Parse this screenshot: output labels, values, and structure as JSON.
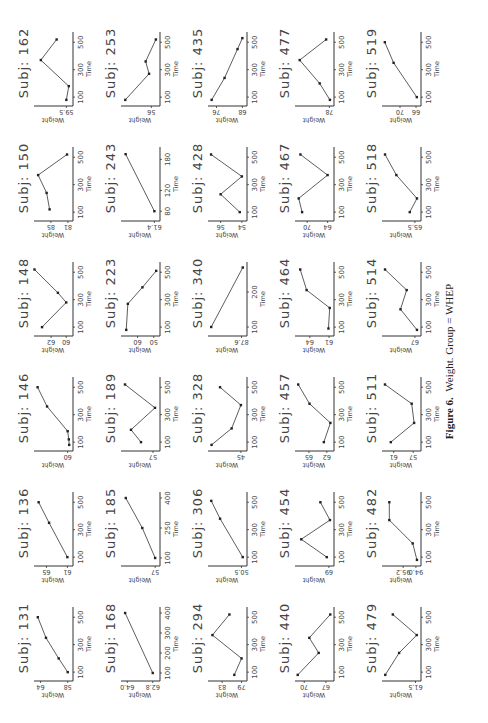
{
  "figure": {
    "caption_label": "Figure 6.",
    "caption_text": "Weight. Group = WHEP"
  },
  "chart_data": {
    "type": "line",
    "xlabel": "Time",
    "ylabel": "Weight",
    "layout": {
      "rows": 5,
      "cols": 6,
      "orientation": "page rotated 90 degrees"
    },
    "panels": [
      {
        "subject": "Subj: 131",
        "xticks": [
          100,
          300,
          500
        ],
        "yticks": [
          58,
          64
        ],
        "xlim": [
          50,
          560
        ],
        "ylim": [
          57.5,
          65
        ],
        "points": [
          [
            100,
            58
          ],
          [
            200,
            60
          ],
          [
            350,
            62.8
          ],
          [
            500,
            64.6
          ]
        ]
      },
      {
        "subject": "Subj: 136",
        "xticks": [
          100,
          300,
          500
        ],
        "yticks": [
          61,
          65
        ],
        "xlim": [
          50,
          560
        ],
        "ylim": [
          60.5,
          67
        ],
        "points": [
          [
            100,
            61
          ],
          [
            350,
            64.5
          ],
          [
            500,
            66.5
          ]
        ]
      },
      {
        "subject": "Subj: 146",
        "xticks": [
          100,
          300,
          500
        ],
        "yticks": [
          60.0
        ],
        "xlim": [
          50,
          560
        ],
        "ylim": [
          59.7,
          64
        ],
        "points": [
          [
            80,
            59.8
          ],
          [
            120,
            59.85
          ],
          [
            180,
            60
          ],
          [
            360,
            62.6
          ],
          [
            500,
            63.8
          ]
        ]
      },
      {
        "subject": "Subj: 148",
        "xticks": [
          100,
          300,
          500
        ],
        "yticks": [
          60,
          62
        ],
        "xlim": [
          50,
          560
        ],
        "ylim": [
          59.5,
          64
        ],
        "points": [
          [
            100,
            63.2
          ],
          [
            280,
            60
          ],
          [
            350,
            61.1
          ],
          [
            520,
            64.2
          ]
        ]
      },
      {
        "subject": "Subj: 150",
        "xticks": [
          100,
          300,
          500
        ],
        "yticks": [
          81,
          85
        ],
        "xlim": [
          50,
          560
        ],
        "ylim": [
          80.5,
          88.5
        ],
        "points": [
          [
            120,
            85.3
          ],
          [
            240,
            86
          ],
          [
            370,
            88
          ],
          [
            520,
            81.2
          ]
        ]
      },
      {
        "subject": "Subj: 162",
        "xticks": [
          100,
          300,
          500
        ],
        "yticks": [
          59.5
        ],
        "xlim": [
          50,
          560
        ],
        "ylim": [
          59.2,
          62
        ],
        "points": [
          [
            80,
            59.5
          ],
          [
            180,
            59.3
          ],
          [
            370,
            61.6
          ],
          [
            520,
            60.3
          ]
        ]
      },
      {
        "subject": "Subj: 168",
        "xticks": [
          100,
          200,
          300,
          400
        ],
        "yticks": [
          62.8,
          64.0
        ],
        "xlim": [
          70,
          420
        ],
        "ylim": [
          62.6,
          64.2
        ],
        "points": [
          [
            100,
            62.8
          ],
          [
            400,
            64.1
          ]
        ]
      },
      {
        "subject": "Subj: 185",
        "xticks": [
          100,
          250,
          400
        ],
        "yticks": [
          57.0
        ],
        "xlim": [
          70,
          420
        ],
        "ylim": [
          56.8,
          60.5
        ],
        "points": [
          [
            100,
            57
          ],
          [
            250,
            58.4
          ],
          [
            400,
            60.2
          ]
        ]
      },
      {
        "subject": "Subj: 189",
        "xticks": [
          100,
          300,
          500
        ],
        "yticks": [
          57.0
        ],
        "xlim": [
          50,
          560
        ],
        "ylim": [
          56.8,
          58.5
        ],
        "points": [
          [
            100,
            57.6
          ],
          [
            190,
            58.1
          ],
          [
            350,
            56.9
          ],
          [
            520,
            58.4
          ]
        ]
      },
      {
        "subject": "Subj: 223",
        "xticks": [
          100,
          300,
          500
        ],
        "yticks": [
          50,
          60
        ],
        "xlim": [
          50,
          560
        ],
        "ylim": [
          48,
          69
        ],
        "points": [
          [
            80,
            67
          ],
          [
            270,
            66
          ],
          [
            390,
            57
          ],
          [
            510,
            48.5
          ]
        ]
      },
      {
        "subject": "Subj: 243",
        "xticks": [
          80,
          120,
          180
        ],
        "yticks": [
          61.4
        ],
        "xlim": [
          65,
          200
        ],
        "ylim": [
          61.3,
          62.6
        ],
        "points": [
          [
            80,
            61.4
          ],
          [
            190,
            62.5
          ]
        ]
      },
      {
        "subject": "Subj: 253",
        "xticks": [
          100,
          300,
          500
        ],
        "yticks": [
          56.0
        ],
        "xlim": [
          50,
          560
        ],
        "ylim": [
          55.5,
          58.5
        ],
        "points": [
          [
            80,
            58.3
          ],
          [
            270,
            56.2
          ],
          [
            360,
            56.5
          ],
          [
            520,
            55.6
          ]
        ]
      },
      {
        "subject": "Subj: 294",
        "xticks": [
          100,
          300,
          500
        ],
        "yticks": [
          79,
          83
        ],
        "xlim": [
          50,
          560
        ],
        "ylim": [
          78.5,
          85.5
        ],
        "points": [
          [
            80,
            80.5
          ],
          [
            200,
            79
          ],
          [
            370,
            85
          ],
          [
            520,
            81.5
          ]
        ]
      },
      {
        "subject": "Subj: 306",
        "xticks": [
          100,
          300,
          500
        ],
        "yticks": [
          50.5
        ],
        "xlim": [
          50,
          560
        ],
        "ylim": [
          50.3,
          53
        ],
        "points": [
          [
            100,
            50.4
          ],
          [
            380,
            52.2
          ],
          [
            510,
            52.9
          ]
        ]
      },
      {
        "subject": "Subj: 328",
        "xticks": [
          100,
          300,
          500
        ],
        "yticks": [
          45.0
        ],
        "xlim": [
          50,
          560
        ],
        "ylim": [
          44.6,
          49
        ],
        "points": [
          [
            80,
            48.8
          ],
          [
            200,
            46.2
          ],
          [
            370,
            45
          ],
          [
            500,
            47.7
          ]
        ]
      },
      {
        "subject": "Subj: 340",
        "xticks": [
          100,
          200
        ],
        "yticks": [
          87.6
        ],
        "xlim": [
          80,
          280
        ],
        "ylim": [
          87.4,
          90.2
        ],
        "points": [
          [
            100,
            90.1
          ],
          [
            270,
            87.5
          ]
        ]
      },
      {
        "subject": "Subj: 428",
        "xticks": [
          100,
          300,
          500
        ],
        "yticks": [
          54.0,
          56.0
        ],
        "xlim": [
          50,
          560
        ],
        "ylim": [
          53.8,
          57
        ],
        "points": [
          [
            100,
            54.2
          ],
          [
            230,
            56
          ],
          [
            360,
            54
          ],
          [
            520,
            56.9
          ]
        ]
      },
      {
        "subject": "Subj: 435",
        "xticks": [
          100,
          300,
          500
        ],
        "yticks": [
          68,
          76
        ],
        "xlim": [
          50,
          560
        ],
        "ylim": [
          67.5,
          78
        ],
        "points": [
          [
            80,
            77.5
          ],
          [
            240,
            73.5
          ],
          [
            450,
            69.5
          ],
          [
            530,
            68
          ]
        ]
      },
      {
        "subject": "Subj: 440",
        "xticks": [
          100,
          300,
          500
        ],
        "yticks": [
          67,
          70
        ],
        "xlim": [
          50,
          560
        ],
        "ylim": [
          66.3,
          71
        ],
        "points": [
          [
            80,
            70.9
          ],
          [
            240,
            68
          ],
          [
            350,
            69.3
          ],
          [
            520,
            66.4
          ]
        ]
      },
      {
        "subject": "Subj: 454",
        "xticks": [
          100,
          300,
          500
        ],
        "yticks": [
          69.0
        ],
        "xlim": [
          50,
          560
        ],
        "ylim": [
          68.8,
          72
        ],
        "points": [
          [
            100,
            69.2
          ],
          [
            230,
            71.6
          ],
          [
            370,
            68.9
          ],
          [
            500,
            69.8
          ]
        ]
      },
      {
        "subject": "Subj: 457",
        "xticks": [
          100,
          300,
          500
        ],
        "yticks": [
          62,
          65
        ],
        "xlim": [
          50,
          560
        ],
        "ylim": [
          61.3,
          67
        ],
        "points": [
          [
            100,
            62.5
          ],
          [
            240,
            61.4
          ],
          [
            380,
            64.9
          ],
          [
            520,
            66.8
          ]
        ]
      },
      {
        "subject": "Subj: 464",
        "xticks": [
          100,
          300,
          500
        ],
        "yticks": [
          61,
          64
        ],
        "xlim": [
          50,
          560
        ],
        "ylim": [
          60.7,
          66
        ],
        "points": [
          [
            90,
            61.1
          ],
          [
            240,
            60.9
          ],
          [
            370,
            64.5
          ],
          [
            520,
            65.5
          ]
        ]
      },
      {
        "subject": "Subj: 467",
        "xticks": [
          100,
          300,
          500
        ],
        "yticks": [
          64,
          70
        ],
        "xlim": [
          50,
          560
        ],
        "ylim": [
          63,
          73
        ],
        "points": [
          [
            100,
            71.5
          ],
          [
            200,
            72.5
          ],
          [
            370,
            64
          ],
          [
            520,
            72
          ]
        ]
      },
      {
        "subject": "Subj: 477",
        "xticks": [
          100,
          300,
          500
        ],
        "yticks": [
          78.0
        ],
        "xlim": [
          50,
          560
        ],
        "ylim": [
          77.7,
          84
        ],
        "points": [
          [
            80,
            77.9
          ],
          [
            200,
            79.8
          ],
          [
            370,
            83.5
          ],
          [
            520,
            78.6
          ]
        ]
      },
      {
        "subject": "Subj: 479",
        "xticks": [
          100,
          300,
          500
        ],
        "yticks": [
          61.5
        ],
        "xlim": [
          50,
          560
        ],
        "ylim": [
          61.3,
          64
        ],
        "points": [
          [
            80,
            63.9
          ],
          [
            240,
            62.8
          ],
          [
            370,
            61.4
          ],
          [
            520,
            63.3
          ]
        ]
      },
      {
        "subject": "Subj: 482",
        "xticks": [
          100,
          300,
          500
        ],
        "yticks": [
          94.0,
          95.2
        ],
        "xlim": [
          50,
          560
        ],
        "ylim": [
          93.8,
          97
        ],
        "points": [
          [
            80,
            93.9
          ],
          [
            200,
            94.3
          ],
          [
            370,
            96.5
          ],
          [
            500,
            96.5
          ]
        ]
      },
      {
        "subject": "Subj: 511",
        "xticks": [
          100,
          300,
          500
        ],
        "yticks": [
          57,
          61
        ],
        "xlim": [
          50,
          560
        ],
        "ylim": [
          56,
          63
        ],
        "points": [
          [
            100,
            61.6
          ],
          [
            240,
            56.8
          ],
          [
            380,
            57.3
          ],
          [
            520,
            62.8
          ]
        ]
      },
      {
        "subject": "Subj: 514",
        "xticks": [
          100,
          300,
          500
        ],
        "yticks": [
          67.0
        ],
        "xlim": [
          50,
          560
        ],
        "ylim": [
          66.7,
          70
        ],
        "points": [
          [
            80,
            66.8
          ],
          [
            230,
            68.4
          ],
          [
            370,
            67.8
          ],
          [
            520,
            69.9
          ]
        ]
      },
      {
        "subject": "Subj: 518",
        "xticks": [
          100,
          300,
          500
        ],
        "yticks": [
          65.5
        ],
        "xlim": [
          50,
          560
        ],
        "ylim": [
          65.2,
          68.5
        ],
        "points": [
          [
            100,
            66
          ],
          [
            200,
            65.3
          ],
          [
            370,
            67.3
          ],
          [
            520,
            68.4
          ]
        ]
      },
      {
        "subject": "Subj: 519",
        "xticks": [
          100,
          300,
          500
        ],
        "yticks": [
          66,
          70
        ],
        "xlim": [
          50,
          560
        ],
        "ylim": [
          65.5,
          74
        ],
        "points": [
          [
            100,
            65.8
          ],
          [
            350,
            71.6
          ],
          [
            500,
            73.8
          ]
        ]
      }
    ]
  }
}
